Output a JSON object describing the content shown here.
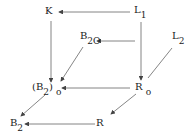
{
  "diagram": {
    "type": "commutative-diagram",
    "nodes": {
      "K": {
        "label": "K"
      },
      "L1": {
        "label": "L",
        "sub": "1"
      },
      "B20": {
        "label": "B",
        "sub": "2O"
      },
      "L2": {
        "label": "L",
        "sub": "2"
      },
      "B2o": {
        "label": "(B",
        "sub": "2",
        "tail": ")",
        "sub2": "o"
      },
      "Ro": {
        "label": "R",
        "sub": "o"
      },
      "B2": {
        "label": "B",
        "sub": "2"
      },
      "R": {
        "label": "R"
      }
    },
    "edges": [
      {
        "from": "L1",
        "to": "K"
      },
      {
        "from": "K",
        "to": "(B2)o"
      },
      {
        "from": "L1",
        "to": "Ro"
      },
      {
        "from": "L2",
        "to": "B2O"
      },
      {
        "from": "B2O",
        "to": "(B2)o"
      },
      {
        "from": "L2",
        "to": "Ro"
      },
      {
        "from": "Ro",
        "to": "(B2)o"
      },
      {
        "from": "Ro",
        "to": "R"
      },
      {
        "from": "(B2)o",
        "to": "B2"
      },
      {
        "from": "R",
        "to": "B2"
      }
    ],
    "colors": {
      "line": "#555555",
      "text": "#222222",
      "background": "#ffffff"
    }
  }
}
